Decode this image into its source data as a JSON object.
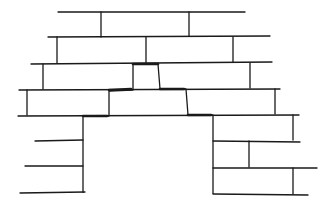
{
  "diagram": {
    "stroke_color": "#1a1a1a",
    "background_color": "#ffffff",
    "courses": [
      {
        "name": "course-1",
        "bed_line": [
          [
            58,
            12
          ],
          [
            245,
            12
          ]
        ],
        "joints": [
          [
            101,
            12,
            101,
            37
          ],
          [
            189,
            12,
            189,
            36
          ]
        ]
      },
      {
        "name": "course-2",
        "bed_line": [
          [
            48,
            37
          ],
          [
            270,
            36
          ]
        ],
        "joints": [
          [
            57,
            37,
            57,
            63
          ],
          [
            146,
            37,
            146,
            63
          ],
          [
            233,
            37,
            233,
            62
          ]
        ]
      },
      {
        "name": "course-3",
        "bed_line": [
          [
            31,
            64
          ],
          [
            272,
            62
          ]
        ],
        "joints": [
          [
            43,
            64,
            43,
            89
          ],
          [
            250,
            63,
            250,
            88
          ]
        ]
      },
      {
        "name": "course-4",
        "bed_line": [
          [
            19,
            90
          ],
          [
            280,
            89
          ]
        ],
        "joints": [
          [
            27,
            90,
            27,
            115
          ],
          [
            275,
            89,
            275,
            114
          ]
        ]
      },
      {
        "name": "course-5",
        "bed_line": [
          [
            18,
            116
          ],
          [
            299,
            115
          ]
        ],
        "joints": [
          [
            293,
            115,
            293,
            140
          ]
        ]
      }
    ],
    "opening_outline": [
      [
        83,
        193
      ],
      [
        83,
        116
      ],
      [
        109,
        116
      ],
      [
        109,
        91
      ],
      [
        133,
        90
      ],
      [
        133,
        64
      ],
      [
        158,
        64
      ],
      [
        160,
        89
      ],
      [
        186,
        89
      ],
      [
        188,
        115
      ],
      [
        213,
        115
      ],
      [
        213,
        194
      ]
    ],
    "thick_edges": [
      [
        [
          133,
          64
        ],
        [
          158,
          64
        ]
      ],
      [
        [
          109,
          90
        ],
        [
          131,
          89
        ]
      ],
      [
        [
          160,
          89
        ],
        [
          184,
          89
        ]
      ],
      [
        [
          83,
          116
        ],
        [
          107,
          116
        ]
      ],
      [
        [
          188,
          115
        ],
        [
          211,
          115
        ]
      ]
    ],
    "left_pier_lines": [
      [
        [
          35,
          141
        ],
        [
          83,
          140
        ]
      ],
      [
        [
          25,
          166
        ],
        [
          83,
          166
        ]
      ],
      [
        [
          20,
          193
        ],
        [
          85,
          192
        ]
      ]
    ],
    "right_pier_lines": [
      [
        [
          213,
          141
        ],
        [
          300,
          142
        ]
      ],
      [
        [
          213,
          168
        ],
        [
          317,
          168
        ]
      ],
      [
        [
          213,
          194
        ],
        [
          308,
          195
        ]
      ]
    ],
    "right_pier_joints": [
      [
        249,
        141,
        249,
        167
      ],
      [
        293,
        168,
        293,
        194
      ]
    ]
  }
}
